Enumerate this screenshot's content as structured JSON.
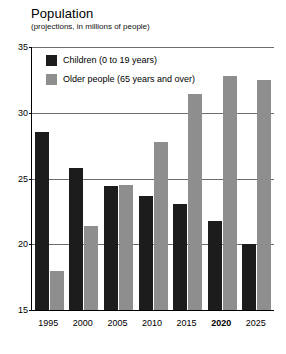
{
  "chart_data": {
    "type": "bar",
    "title": "Population",
    "subtitle": "(projections, in millions of people)",
    "xlabel": "",
    "ylabel": "",
    "ylim": [
      15,
      35
    ],
    "yticks": [
      15,
      20,
      25,
      30,
      35
    ],
    "grid": true,
    "legend_position": "inside-top-left",
    "categories": [
      "1995",
      "2000",
      "2005",
      "2010",
      "2015",
      "2020",
      "2025"
    ],
    "emphasized_category": "2020",
    "series": [
      {
        "name": "Children (0 to 19 years)",
        "color": "#1c1c1c",
        "values": [
          28.5,
          25.8,
          24.4,
          23.7,
          23.1,
          21.8,
          20.0
        ]
      },
      {
        "name": "Older people (65 years and over)",
        "color": "#8e8e8e",
        "values": [
          18.0,
          21.4,
          24.5,
          27.8,
          31.4,
          32.8,
          32.5
        ]
      }
    ]
  },
  "legend": {
    "items": [
      {
        "label": "Children (0 to 19 years)"
      },
      {
        "label": "Older people (65 years and over)"
      }
    ]
  },
  "axis": {
    "y_tick_labels": [
      "35",
      "30",
      "25",
      "20",
      "15"
    ],
    "x_tick_labels": [
      "1995",
      "2000",
      "2005",
      "2010",
      "2015",
      "2020",
      "2025"
    ]
  },
  "colors": {
    "children": "#1c1c1c",
    "older": "#8e8e8e",
    "gridline": "#6d6d6d",
    "axis": "#000000",
    "background": "#ffffff"
  }
}
